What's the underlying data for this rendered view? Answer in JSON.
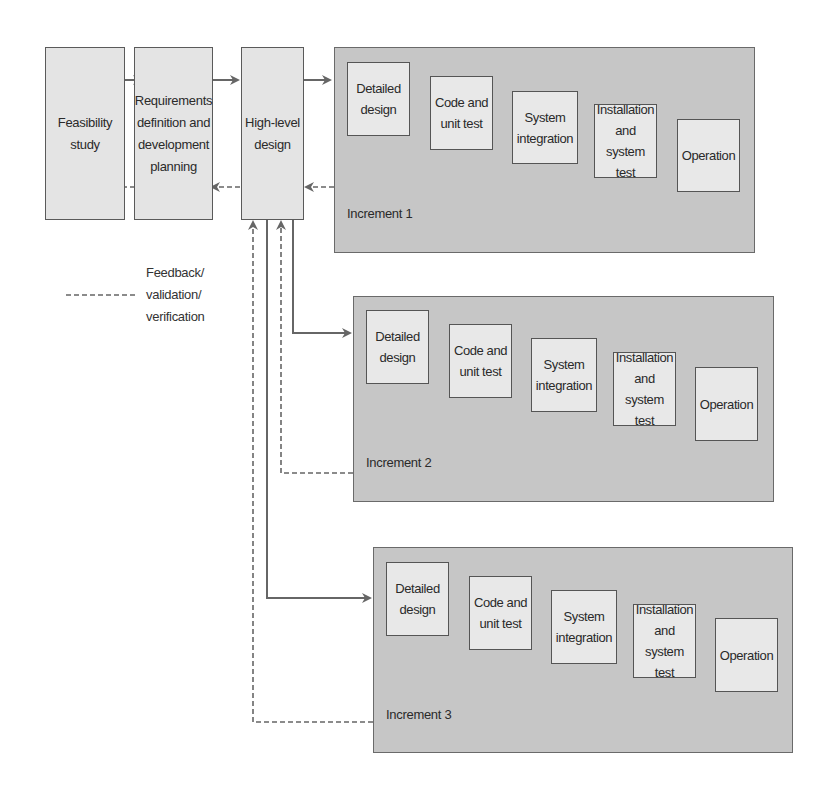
{
  "diagram": {
    "type": "incremental development lifecycle",
    "colors": {
      "stage_fill": "#e4e4e4",
      "panel_fill": "#c6c6c6",
      "line": "#666666",
      "border": "#555555"
    },
    "front_stages": [
      {
        "id": "feasibility",
        "label": "Feasibility\nstudy"
      },
      {
        "id": "requirements",
        "label": "Requirements\ndefinition and\ndevelopment\nplanning"
      },
      {
        "id": "high_level_design",
        "label": "High-level\ndesign"
      }
    ],
    "increments": [
      {
        "label": "Increment 1",
        "stages": [
          "Detailed\ndesign",
          "Code and\nunit test",
          "System\nintegration",
          "Installation\nand system\ntest",
          "Operation"
        ]
      },
      {
        "label": "Increment 2",
        "stages": [
          "Detailed\ndesign",
          "Code and\nunit test",
          "System\nintegration",
          "Installation\nand system\ntest",
          "Operation"
        ]
      },
      {
        "label": "Increment 3",
        "stages": [
          "Detailed\ndesign",
          "Code and\nunit test",
          "System\nintegration",
          "Installation\nand system\ntest",
          "Operation"
        ]
      }
    ],
    "legend": {
      "line_style": "dashed",
      "label": "Feedback/\nvalidation/\nverification"
    }
  }
}
